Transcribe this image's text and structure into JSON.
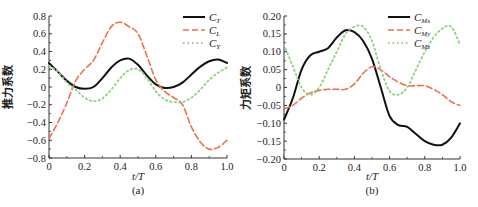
{
  "chart_data": [
    {
      "type": "line",
      "panel_label": "(a)",
      "xlabel": "t/T",
      "ylabel": "推力系数",
      "xlim": [
        0,
        1.0
      ],
      "ylim": [
        -0.8,
        0.8
      ],
      "xticks": [
        "0",
        "0.2",
        "0.4",
        "0.6",
        "0.8",
        "1.0"
      ],
      "yticks": [
        "0.8",
        "0.6",
        "0.4",
        "0.2",
        "0",
        "-0.2",
        "-0.4",
        "-0.6",
        "-0.8"
      ],
      "grid": false,
      "legend_position": "upper right",
      "x": [
        0,
        0.05,
        0.1,
        0.15,
        0.2,
        0.25,
        0.3,
        0.35,
        0.4,
        0.45,
        0.5,
        0.55,
        0.6,
        0.65,
        0.7,
        0.75,
        0.8,
        0.85,
        0.9,
        0.95,
        1.0
      ],
      "series": [
        {
          "name": "C_T",
          "label_main": "C",
          "label_sub": "T",
          "style": "solid",
          "color": "#111111",
          "values": [
            0.27,
            0.17,
            0.07,
            0.0,
            -0.02,
            0.0,
            0.1,
            0.22,
            0.3,
            0.32,
            0.25,
            0.13,
            0.03,
            -0.01,
            0.0,
            0.05,
            0.14,
            0.23,
            0.29,
            0.31,
            0.27
          ]
        },
        {
          "name": "C_L",
          "label_main": "C",
          "label_sub": "L",
          "style": "dashed",
          "color": "#e8724f",
          "values": [
            -0.58,
            -0.4,
            -0.18,
            0.07,
            0.2,
            0.3,
            0.5,
            0.68,
            0.73,
            0.68,
            0.6,
            0.35,
            0.08,
            -0.05,
            -0.12,
            -0.2,
            -0.45,
            -0.62,
            -0.7,
            -0.68,
            -0.6
          ]
        },
        {
          "name": "C_Y",
          "label_main": "C",
          "label_sub": "Y",
          "style": "dotted",
          "color": "#8fcf7e",
          "values": [
            0.24,
            0.17,
            0.05,
            -0.03,
            -0.12,
            -0.16,
            -0.13,
            -0.03,
            0.1,
            0.19,
            0.2,
            0.1,
            -0.05,
            -0.14,
            -0.17,
            -0.17,
            -0.12,
            -0.03,
            0.08,
            0.16,
            0.22
          ]
        }
      ]
    },
    {
      "type": "line",
      "panel_label": "(b)",
      "xlabel": "t/T",
      "ylabel": "力矩系数",
      "xlim": [
        0,
        1.0
      ],
      "ylim": [
        -0.2,
        0.2
      ],
      "xticks": [
        "0",
        "0.2",
        "0.4",
        "0.6",
        "0.8",
        "1.0"
      ],
      "yticks": [
        "0.20",
        "0.15",
        "0.10",
        "0.05",
        "0",
        "-0.05",
        "-0.10",
        "-0.15",
        "-0.20"
      ],
      "grid": false,
      "legend_position": "upper right",
      "x": [
        0,
        0.05,
        0.1,
        0.15,
        0.2,
        0.25,
        0.3,
        0.35,
        0.4,
        0.45,
        0.5,
        0.55,
        0.6,
        0.65,
        0.7,
        0.75,
        0.8,
        0.85,
        0.9,
        0.95,
        1.0
      ],
      "series": [
        {
          "name": "C_Mx",
          "label_main": "C",
          "label_sub": "Mx",
          "style": "solid",
          "color": "#111111",
          "values": [
            -0.09,
            -0.03,
            0.05,
            0.09,
            0.1,
            0.11,
            0.14,
            0.16,
            0.155,
            0.13,
            0.08,
            0.0,
            -0.08,
            -0.105,
            -0.11,
            -0.13,
            -0.15,
            -0.16,
            -0.16,
            -0.14,
            -0.1
          ]
        },
        {
          "name": "C_My",
          "label_main": "C",
          "label_sub": "My",
          "style": "dashed",
          "color": "#e8724f",
          "values": [
            -0.06,
            -0.05,
            -0.03,
            -0.015,
            -0.008,
            -0.005,
            -0.005,
            -0.005,
            0.01,
            0.04,
            0.058,
            0.05,
            0.03,
            0.015,
            0.005,
            0.005,
            0.005,
            -0.005,
            -0.02,
            -0.04,
            -0.05
          ]
        },
        {
          "name": "C_Mz",
          "label_main": "C",
          "label_sub": "Mz",
          "style": "dotted",
          "color": "#8fcf7e",
          "values": [
            0.12,
            0.06,
            0.0,
            -0.02,
            0.0,
            0.05,
            0.1,
            0.15,
            0.17,
            0.17,
            0.13,
            0.05,
            -0.01,
            -0.02,
            0.0,
            0.05,
            0.1,
            0.14,
            0.165,
            0.17,
            0.12
          ]
        }
      ]
    }
  ]
}
